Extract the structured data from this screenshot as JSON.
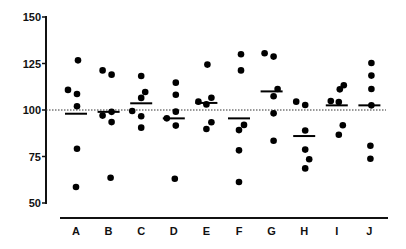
{
  "chart_data": {
    "type": "scatter",
    "subtype": "dot-plot-with-median",
    "title": "",
    "xlabel": "",
    "ylabel": "",
    "ylim": [
      50,
      150
    ],
    "yticks": [
      50,
      75,
      100,
      125,
      150
    ],
    "grid": false,
    "legend": null,
    "reference_line": {
      "y": 100,
      "style": "dotted"
    },
    "categories": [
      "A",
      "B",
      "C",
      "D",
      "E",
      "F",
      "G",
      "H",
      "I",
      "J"
    ],
    "groups": [
      {
        "category": "A",
        "values": [
          126.7,
          110.8,
          108.6,
          102.0,
          79.2,
          58.6
        ],
        "median": 98.0
      },
      {
        "category": "B",
        "values": [
          121.3,
          119.0,
          97.0,
          99.0,
          93.5,
          63.6
        ],
        "median": 99.0
      },
      {
        "category": "C",
        "values": [
          118.3,
          109.7,
          106.5,
          99.5,
          96.6,
          90.5
        ],
        "median": 103.6
      },
      {
        "category": "D",
        "values": [
          114.7,
          108.2,
          99.1,
          95.5,
          91.6,
          63.0
        ],
        "median": 95.5
      },
      {
        "category": "E",
        "values": [
          124.4,
          106.6,
          104.5,
          103.0,
          93.4,
          89.8
        ],
        "median": 103.8
      },
      {
        "category": "F",
        "values": [
          130.0,
          121.3,
          92.0,
          89.2,
          78.3,
          61.3
        ],
        "median": 95.5
      },
      {
        "category": "G",
        "values": [
          130.5,
          128.7,
          111.3,
          107.4,
          98.2,
          83.5
        ],
        "median": 110.0
      },
      {
        "category": "H",
        "values": [
          104.5,
          102.7,
          89.0,
          78.7,
          73.5,
          68.6
        ],
        "median": 86.0
      },
      {
        "category": "I",
        "values": [
          113.3,
          111.1,
          104.8,
          104.3,
          91.8,
          86.7
        ],
        "median": 102.5
      },
      {
        "category": "J",
        "values": [
          125.3,
          118.5,
          111.3,
          102.5,
          80.8,
          73.8
        ],
        "median": 102.5
      }
    ],
    "point_offsets": {
      "A": [
        2,
        -8,
        1,
        1,
        1,
        0
      ],
      "B": [
        -6,
        3,
        -6,
        3,
        3,
        2
      ],
      "C": [
        0,
        4,
        0,
        -9,
        0,
        0
      ],
      "D": [
        2,
        2,
        2,
        -7,
        2,
        1
      ],
      "E": [
        1,
        5,
        -8,
        0,
        5,
        0
      ],
      "F": [
        2,
        2,
        5,
        0,
        0,
        0
      ],
      "G": [
        -7,
        2,
        6,
        2,
        2,
        2
      ],
      "H": [
        -8,
        1,
        1,
        1,
        5,
        1
      ],
      "I": [
        7,
        3,
        -6,
        2,
        6,
        2
      ],
      "J": [
        2,
        2,
        2,
        2,
        1,
        1
      ]
    }
  }
}
